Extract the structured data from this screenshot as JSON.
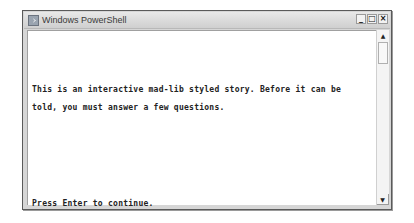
{
  "window": {
    "title": "Windows PowerShell",
    "icon": "powershell-icon",
    "controls": {
      "minimize": "_",
      "maximize": "□",
      "close": "×"
    }
  },
  "console": {
    "lines": [
      "This is an interactive mad-lib styled story. Before it can be",
      "told, you must answer a few questions.",
      "Press Enter to continue."
    ]
  },
  "scrollbar": {
    "up": "▲",
    "down": "▼"
  }
}
